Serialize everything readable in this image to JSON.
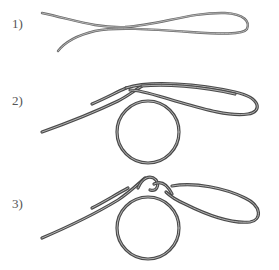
{
  "steps": [
    {
      "label": "1)",
      "description": "rope-folded-loop"
    },
    {
      "label": "2)",
      "description": "rope-wrapped-around-ring"
    },
    {
      "label": "3)",
      "description": "knot-tightened-on-ring"
    }
  ],
  "colors": {
    "rope_outline": "#4a4a4a",
    "rope_highlight": "#b5b5b5",
    "label": "#555555",
    "background": "#ffffff"
  }
}
